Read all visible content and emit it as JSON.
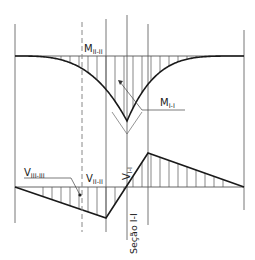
{
  "diagram": {
    "type": "bending-moment-and-shear-diagram",
    "labels": {
      "m_ii": {
        "main": "M",
        "sub": "II-II"
      },
      "m_i": {
        "main": "M",
        "sub": "I-I"
      },
      "v_iii": {
        "main": "V",
        "sub": "III-III"
      },
      "v_ii": {
        "main": "V",
        "sub": "II-II"
      },
      "v_i": {
        "main": "V",
        "sub": "I-I"
      },
      "section": "Seção I-I"
    },
    "colors": {
      "curve": "#1a1a1a",
      "thin": "#555555",
      "dashed": "#888888"
    }
  }
}
